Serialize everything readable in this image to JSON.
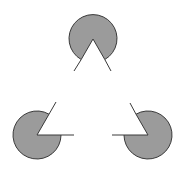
{
  "figure": {
    "title": "",
    "type": "Kanizsa triangle illusion",
    "colors": {
      "background": "#ffffff",
      "fill": "#9b9b9b",
      "stroke": "#3a3a3a"
    },
    "pacmen": [
      {
        "name": "top",
        "cx": 93,
        "cy": 38,
        "r": 24
      },
      {
        "name": "bottom-left",
        "cx": 37,
        "cy": 135,
        "r": 24
      },
      {
        "name": "bottom-right",
        "cx": 148,
        "cy": 135,
        "r": 24
      }
    ]
  }
}
